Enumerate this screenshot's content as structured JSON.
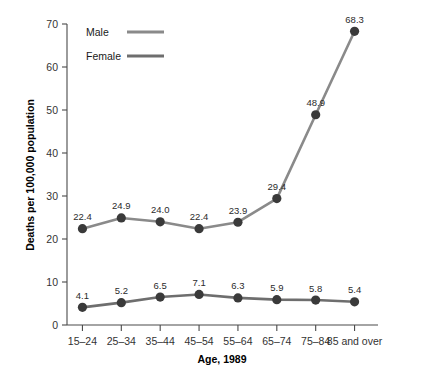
{
  "chart_data": {
    "type": "line",
    "title": "",
    "xlabel": "Age, 1989",
    "ylabel": "Deaths per 100,000 population",
    "categories": [
      "15–24",
      "25–34",
      "35–44",
      "45–54",
      "55–64",
      "65–74",
      "75–84",
      "85 and over"
    ],
    "ylim": [
      0,
      70
    ],
    "yticks": [
      0,
      10,
      20,
      30,
      40,
      50,
      60,
      70
    ],
    "ytick_labels": [
      "0",
      "10",
      "20",
      "30",
      "40",
      "50",
      "60",
      "70"
    ],
    "grid": false,
    "legend_position": "top-left-inside",
    "series": [
      {
        "name": "Male",
        "color": "#8a8a8a",
        "marker_color": "#3a3a3a",
        "values": [
          22.4,
          24.9,
          24.0,
          22.4,
          23.9,
          29.4,
          48.9,
          68.3
        ],
        "labels": [
          "22.4",
          "24.9",
          "24.0",
          "22.4",
          "23.9",
          "29.4",
          "48.9",
          "68.3"
        ]
      },
      {
        "name": "Female",
        "color": "#6e6e6e",
        "marker_color": "#3a3a3a",
        "values": [
          4.1,
          5.2,
          6.5,
          7.1,
          6.3,
          5.9,
          5.8,
          5.4
        ],
        "labels": [
          "4.1",
          "5.2",
          "6.5",
          "7.1",
          "6.3",
          "5.9",
          "5.8",
          "5.4"
        ]
      }
    ]
  },
  "legend": {
    "items": [
      {
        "label": "Male",
        "color": "#8a8a8a"
      },
      {
        "label": "Female",
        "color": "#6e6e6e"
      }
    ]
  },
  "colors": {
    "male_line": "#8a8a8a",
    "female_line": "#6e6e6e",
    "marker": "#3a3a3a",
    "axis": "#4a4a4a",
    "text": "#1a1a1a",
    "background": "#ffffff"
  }
}
